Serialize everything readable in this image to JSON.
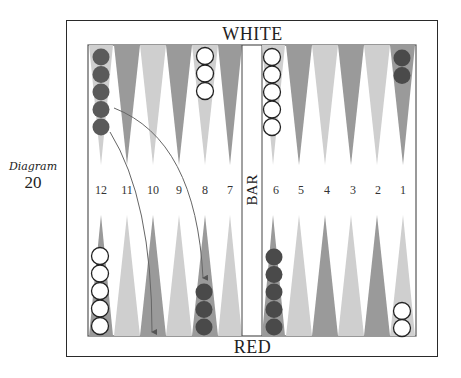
{
  "caption": {
    "word": "Diagram",
    "number": "20"
  },
  "labels": {
    "top": "WHITE",
    "bottom": "RED",
    "bar": "BAR"
  },
  "colors": {
    "frame": "#2a2a2a",
    "point_dark": "#9a9a9a",
    "point_light": "#cfcfcf",
    "red_checker": "#555555",
    "white_checker": "#ffffff",
    "arrow": "#666666"
  },
  "point_numbers": {
    "left": [
      "12",
      "11",
      "10",
      "9",
      "8",
      "7"
    ],
    "right": [
      "6",
      "5",
      "4",
      "3",
      "2",
      "1"
    ]
  },
  "checkers": {
    "top": [
      {
        "column": "12",
        "color": "red",
        "count": 5
      },
      {
        "column": "8",
        "color": "white",
        "count": 3
      },
      {
        "column": "6",
        "color": "white",
        "count": 5
      },
      {
        "column": "1",
        "color": "red",
        "count": 2
      }
    ],
    "bottom": [
      {
        "column": "12",
        "color": "white",
        "count": 5
      },
      {
        "column": "8",
        "color": "red",
        "count": 3
      },
      {
        "column": "6",
        "color": "red",
        "count": 5
      },
      {
        "column": "1",
        "color": "white",
        "count": 2
      }
    ]
  },
  "arrows": [
    {
      "from": "top-12 checker 4",
      "to": "point 8"
    },
    {
      "from": "top-12 checker 5",
      "to": "point 10"
    }
  ]
}
